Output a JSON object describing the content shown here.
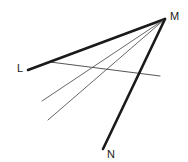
{
  "figure": {
    "background_color": "#ffffff",
    "stroke_color": "#1a1a1a",
    "thin_stroke_color": "#555555",
    "width": 188,
    "height": 162,
    "labels": [
      {
        "id": "label-L",
        "text": "L",
        "x": 17,
        "y": 72
      },
      {
        "id": "label-M",
        "text": "M",
        "x": 170,
        "y": 20
      },
      {
        "id": "label-N",
        "text": "N",
        "x": 107,
        "y": 158
      }
    ],
    "vertex": {
      "name": "M",
      "x": 165,
      "y": 19
    },
    "rays": [
      {
        "id": "ray-ML",
        "name": "ray-m-to-l",
        "from_x": 165,
        "from_y": 19,
        "to_x": 28,
        "to_y": 70,
        "width": 2.6,
        "color": "#1a1a1a",
        "endpoint_label": "L"
      },
      {
        "id": "ray-M-thin-upper",
        "name": "ray-m-thin-upper",
        "from_x": 165,
        "from_y": 19,
        "to_x": 42,
        "to_y": 101,
        "width": 0.9,
        "color": "#555555",
        "endpoint_label": ""
      },
      {
        "id": "ray-M-thin-lower",
        "name": "ray-m-thin-lower",
        "from_x": 165,
        "from_y": 19,
        "to_x": 48,
        "to_y": 120,
        "width": 0.9,
        "color": "#555555",
        "endpoint_label": ""
      },
      {
        "id": "ray-MN",
        "name": "ray-m-to-n",
        "from_x": 165,
        "from_y": 19,
        "to_x": 103,
        "to_y": 149,
        "width": 2.6,
        "color": "#1a1a1a",
        "endpoint_label": "N"
      }
    ],
    "transversal": {
      "id": "transversal-line",
      "name": "transversal-line",
      "from_x": 50,
      "from_y": 62,
      "to_x": 160,
      "to_y": 76,
      "width": 1.0,
      "color": "#555555"
    }
  }
}
